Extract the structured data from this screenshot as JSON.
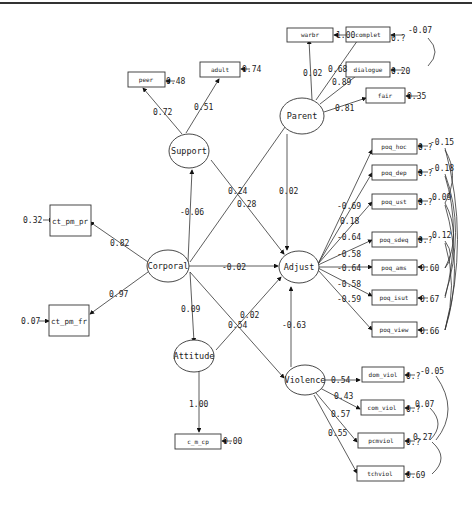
{
  "latents": [
    {
      "id": "Parent",
      "label": "Parent"
    },
    {
      "id": "Support",
      "label": "Support"
    },
    {
      "id": "Corporal",
      "label": "Corporal"
    },
    {
      "id": "Adjust",
      "label": "Adjust"
    },
    {
      "id": "Attitude",
      "label": "Attitude"
    },
    {
      "id": "Violence",
      "label": "Violence"
    }
  ],
  "observed": [
    {
      "id": "warm",
      "label": "warbr",
      "residual": "1.00"
    },
    {
      "id": "complet",
      "label": "complet",
      "residual": "0.?"
    },
    {
      "id": "dialogue",
      "label": "dialogue",
      "residual": "0.20"
    },
    {
      "id": "fair",
      "label": "fair",
      "residual": "0.35"
    },
    {
      "id": "peer",
      "label": "peer",
      "residual": "0.48"
    },
    {
      "id": "adult",
      "label": "adult",
      "residual": "0.74"
    },
    {
      "id": "ct_pm_pr",
      "label": "ct_pm_pr",
      "residual": "0.32"
    },
    {
      "id": "ct_pm_fr",
      "label": "ct_pm_fr",
      "residual": "0.07"
    },
    {
      "id": "c_m_cp",
      "label": "c_m_cp",
      "residual": "0.00"
    },
    {
      "id": "poq_hoc",
      "label": "poq_hoc",
      "residual": "0.?"
    },
    {
      "id": "poq_dep",
      "label": "poq_dep",
      "residual": "0.?"
    },
    {
      "id": "poq_ust",
      "label": "poq_ust",
      "residual": "0.?"
    },
    {
      "id": "poq_sdeq",
      "label": "poq_sdeq",
      "residual": "0.?"
    },
    {
      "id": "poq_ams",
      "label": "poq_ams",
      "residual": "0.60"
    },
    {
      "id": "poq_isut",
      "label": "poq_isut",
      "residual": "0.67"
    },
    {
      "id": "poq_view",
      "label": "poq_view",
      "residual": "0.66"
    },
    {
      "id": "dom_viol",
      "label": "dom_viol",
      "residual": "0.?"
    },
    {
      "id": "com_viol",
      "label": "com_viol",
      "residual": "0.?"
    },
    {
      "id": "pcmviol",
      "label": "pcmviol",
      "residual": "0.?"
    },
    {
      "id": "tchviol",
      "label": "tchviol",
      "residual": "0.69"
    }
  ],
  "loadings": {
    "parent_warm": "0.02",
    "parent_complet": "0.68",
    "parent_dialogue": "0.89",
    "parent_fair": "0.81",
    "support_peer": "0.72",
    "support_adult": "0.51",
    "corporal_pr": "0.82",
    "corporal_fr": "0.97",
    "attitude_cmcp": "1.00",
    "adjust_1": "-0.69",
    "adjust_2": "0.18",
    "adjust_3": "-0.64",
    "adjust_4": "-0.58",
    "adjust_5": "-0.64",
    "adjust_6": "-0.58",
    "adjust_7": "-0.59",
    "violence_1": "0.54",
    "violence_2": "0.43",
    "violence_3": "0.57",
    "violence_4": "0.55"
  },
  "paths": {
    "corporal_support": "-0.06",
    "corporal_parent": "0.24",
    "support_adjust": "0.28",
    "parent_adjust": "0.02",
    "corporal_adjust": "-0.02",
    "corporal_attitude": "0.09",
    "corporal_violence": "0.54",
    "attitude_adjust": "0.02",
    "violence_adjust": "-0.63"
  },
  "correlations": {
    "complet_dialogue": "-0.07",
    "poq_hoc": "-0.15",
    "poq_dep": "-0.18",
    "poq_ust": "0.09",
    "poq_sdeq": "0.12",
    "dom_com": "-0.05",
    "com_pcm": "0.07",
    "pcm_tch": "0.27"
  }
}
